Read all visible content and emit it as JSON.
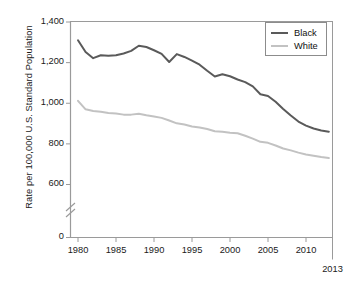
{
  "chart_data": {
    "type": "line",
    "title": "",
    "xlabel": "",
    "ylabel": "Rate per 100,000 U.S. Standard Population",
    "xlim": [
      1979,
      2013
    ],
    "ylim": [
      560,
      1420
    ],
    "grid": false,
    "legend_position": "top-right",
    "y_axis_break": true,
    "y_ticks": [
      "1,400",
      "1,200",
      "1,000",
      "800",
      "600",
      "0"
    ],
    "y_tick_values": [
      1400,
      1200,
      1000,
      800,
      600,
      0
    ],
    "x_ticks": [
      "1980",
      "1985",
      "1990",
      "1995",
      "2000",
      "2005",
      "2010"
    ],
    "x_tick_values": [
      1980,
      1985,
      1990,
      1995,
      2000,
      2005,
      2010
    ],
    "x_end_label": "2013",
    "x": [
      1980,
      1981,
      1982,
      1983,
      1984,
      1985,
      1986,
      1987,
      1988,
      1989,
      1990,
      1991,
      1992,
      1993,
      1994,
      1995,
      1996,
      1997,
      1998,
      1999,
      2000,
      2001,
      2002,
      2003,
      2004,
      2005,
      2006,
      2007,
      2008,
      2009,
      2010,
      2011,
      2012,
      2013
    ],
    "series": [
      {
        "name": "Black",
        "color": "#5a5a5a",
        "values": [
          1310,
          1252,
          1222,
          1236,
          1234,
          1236,
          1245,
          1258,
          1283,
          1277,
          1261,
          1243,
          1203,
          1242,
          1228,
          1210,
          1190,
          1160,
          1132,
          1143,
          1133,
          1117,
          1104,
          1083,
          1044,
          1036,
          1007,
          972,
          940,
          910,
          890,
          876,
          866,
          860
        ]
      },
      {
        "name": "White",
        "color": "#c2c2c2",
        "values": [
          1012,
          970,
          962,
          958,
          952,
          950,
          944,
          944,
          948,
          941,
          935,
          928,
          915,
          901,
          895,
          886,
          881,
          873,
          862,
          860,
          855,
          852,
          840,
          826,
          810,
          805,
          792,
          777,
          768,
          757,
          748,
          742,
          735,
          730
        ]
      }
    ]
  },
  "legend": {
    "items": [
      {
        "label": "Black",
        "color": "#5a5a5a"
      },
      {
        "label": "White",
        "color": "#c2c2c2"
      }
    ]
  }
}
